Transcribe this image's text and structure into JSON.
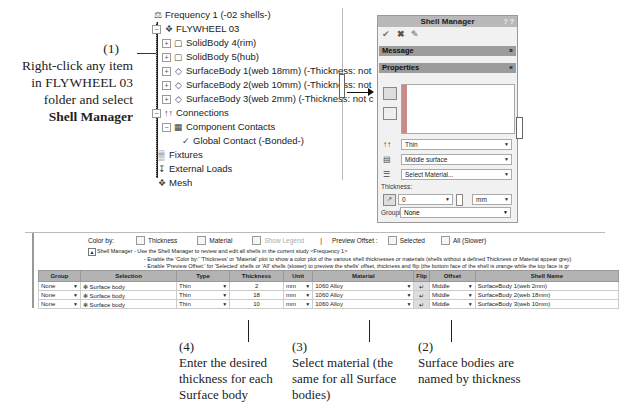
{
  "callouts": {
    "c1": {
      "num": "(1)",
      "line1": "Right-click any item",
      "line2": "in FLYWHEEL 03",
      "line3": "folder and select",
      "bold": "Shell Manager"
    },
    "c2": {
      "num": "(2)",
      "line1": "Surface bodies are",
      "line2": "named by thickness"
    },
    "c3": {
      "num": "(3)",
      "line1": "Select material (the",
      "line2": "same for all Surface",
      "line3": "bodies)"
    },
    "c4": {
      "num": "(4)",
      "line1": "Enter the desired",
      "line2": "thickness for each",
      "line3": "Surface body"
    }
  },
  "tree": {
    "study": "Frequency 1 (-02 shells-)",
    "part": "FLYWHEEL 03",
    "bodies": [
      "SolidBody 4(rim)",
      "SolidBody 5(hub)",
      "SurfaceBody 1(web 18mm) (-Thickness: not",
      "SurfaceBody 2(web 10mm) (-Thickness: not",
      "SurfaceBody 3(web 2mm) (-Thickness: not c"
    ],
    "connections": "Connections",
    "component_contacts": "Component Contacts",
    "global_contact": "Global Contact (-Bonded-)",
    "fixtures": "Fixtures",
    "external_loads": "External Loads",
    "mesh": "Mesh"
  },
  "panel": {
    "title": "Shell Manager",
    "message_label": "Message",
    "properties_label": "Properties",
    "type_value": "Thin",
    "offset_value": "Middle surface",
    "material_value": "Select Material...",
    "thickness_label": "Thickness:",
    "thickness_value": "0",
    "unit_value": "mm",
    "grouping_label": "Grouping (Optional):",
    "grouping_value": "None"
  },
  "table_panel": {
    "color_by_label": "Color by:",
    "thickness_cb": "Thickness",
    "material_cb": "Material",
    "show_legend_cb": "Show Legend",
    "separator": "|",
    "preview_offset_label": "Preview Offset :",
    "selected_cb": "Selected",
    "all_cb": "All (Slower)",
    "info1": "Shell Manager - Use the Shell Manager to review and edit all shells in the current study <Frequency 1>",
    "info2": "- Enable the 'Color by:' 'Thickness' or 'Material' plot to show a color plot of the various shell thicknesses or materials (shells without a defined Thickness or Material appear grey)",
    "info3": "- Enable 'Preview Offset:' for 'Selected' shells or 'All' shells (slower) to preview the shells' offset, thickness and flip (the bottom face of the shell is orange while the top face is gr",
    "headers": [
      "Group",
      "Selection",
      "Type",
      "Thickness",
      "Unit",
      "Material",
      "Flip",
      "Offset",
      "Shell Name"
    ],
    "rows": [
      {
        "group": "None",
        "selection": "Surface body",
        "type": "Thin",
        "thickness": "2",
        "unit": "mm",
        "material": "1060 Alloy",
        "offset": "Middle",
        "name": "SurfaceBody 1(web 2mm)"
      },
      {
        "group": "None",
        "selection": "Surface body",
        "type": "Thin",
        "thickness": "18",
        "unit": "mm",
        "material": "1060 Alloy",
        "offset": "Middle",
        "name": "SurfaceBody 2(web 18mm)"
      },
      {
        "group": "None",
        "selection": "Surface body",
        "type": "Thin",
        "thickness": "10",
        "unit": "mm",
        "material": "1060 Alloy",
        "offset": "Middle",
        "name": "SurfaceBody 3(web 10mm)"
      }
    ]
  }
}
